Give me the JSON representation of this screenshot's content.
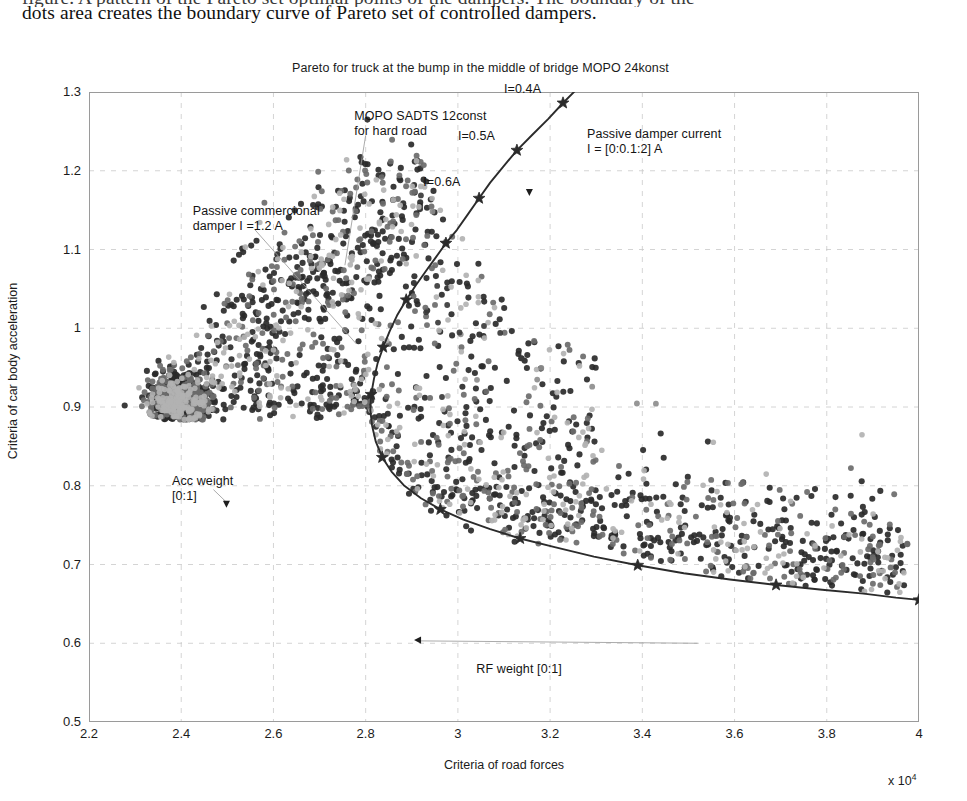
{
  "document": {
    "line_clipped": "figure. A pattern of the Pareto set optimal points of the dampers. The boundary of the",
    "line_full": "dots area creates the boundary curve of Pareto set of controlled dampers."
  },
  "chart_data": {
    "type": "scatter",
    "title": "Pareto  for truck at the bump in the middle of bridge  MOPO 24konst",
    "xlabel": "Criteria of road forces",
    "ylabel": "Criteria of car body acceleration",
    "x_multiplier": "x 10",
    "x_multiplier_exponent": "4",
    "xlim": [
      2.2,
      4.0
    ],
    "ylim": [
      0.5,
      1.3
    ],
    "xticks": [
      "2.2",
      "2.4",
      "2.6",
      "2.8",
      "3",
      "3.2",
      "3.4",
      "3.6",
      "3.8",
      "4"
    ],
    "yticks": [
      "0.5",
      "0.6",
      "0.7",
      "0.8",
      "0.9",
      "1",
      "1.1",
      "1.2",
      "1.3"
    ],
    "grid": true,
    "legend": "none",
    "series": [
      {
        "name": "Pareto boundary curve (controlled dampers)",
        "type": "line",
        "color": "#2b2b2b",
        "marker": "star",
        "points": [
          [
            3.33,
            1.345
          ],
          [
            3.295,
            1.325
          ],
          [
            3.26,
            1.305
          ],
          [
            3.228,
            1.286
          ],
          [
            3.196,
            1.266
          ],
          [
            3.162,
            1.246
          ],
          [
            3.128,
            1.226
          ],
          [
            3.098,
            1.205
          ],
          [
            3.07,
            1.185
          ],
          [
            3.046,
            1.165
          ],
          [
            3.022,
            1.145
          ],
          [
            2.998,
            1.125
          ],
          [
            2.974,
            1.108
          ],
          [
            2.952,
            1.09
          ],
          [
            2.93,
            1.072
          ],
          [
            2.908,
            1.054
          ],
          [
            2.888,
            1.036
          ],
          [
            2.868,
            1.016
          ],
          [
            2.852,
            0.996
          ],
          [
            2.838,
            0.976
          ],
          [
            2.826,
            0.956
          ],
          [
            2.818,
            0.936
          ],
          [
            2.812,
            0.916
          ],
          [
            2.81,
            0.896
          ],
          [
            2.814,
            0.876
          ],
          [
            2.822,
            0.856
          ],
          [
            2.836,
            0.836
          ],
          [
            2.856,
            0.818
          ],
          [
            2.884,
            0.8
          ],
          [
            2.92,
            0.784
          ],
          [
            2.962,
            0.77
          ],
          [
            3.012,
            0.757
          ],
          [
            3.07,
            0.745
          ],
          [
            3.135,
            0.733
          ],
          [
            3.21,
            0.722
          ],
          [
            3.295,
            0.71
          ],
          [
            3.39,
            0.699
          ],
          [
            3.49,
            0.689
          ],
          [
            3.59,
            0.681
          ],
          [
            3.69,
            0.674
          ],
          [
            3.79,
            0.668
          ],
          [
            3.88,
            0.663
          ],
          [
            3.95,
            0.658
          ],
          [
            4.0,
            0.655
          ]
        ],
        "star_markers": [
          [
            3.228,
            1.286
          ],
          [
            3.128,
            1.226
          ],
          [
            3.046,
            1.165
          ],
          [
            2.974,
            1.108
          ],
          [
            2.888,
            1.036
          ],
          [
            2.838,
            0.976
          ],
          [
            2.812,
            0.916
          ],
          [
            2.836,
            0.836
          ],
          [
            2.962,
            0.77
          ],
          [
            3.135,
            0.733
          ],
          [
            3.39,
            0.699
          ],
          [
            3.69,
            0.674
          ],
          [
            4.0,
            0.655
          ]
        ]
      },
      {
        "name": "Controlled damper optimal points (dark)",
        "type": "scatter-cloud",
        "color": "#2a2a2a",
        "count": 1400
      },
      {
        "name": "Controlled damper optimal points (mid)",
        "type": "scatter-cloud",
        "color": "#6b6b6b",
        "count": 700
      },
      {
        "name": "Controlled damper optimal points (light)",
        "type": "scatter-cloud",
        "color": "#b2b2b2",
        "count": 520
      }
    ],
    "annotations": [
      {
        "id": "pareto-current-label",
        "text": "Passive damper current\nI = [0:0.1:2] A",
        "x": 3.28,
        "y": 1.245
      },
      {
        "id": "current-04",
        "text": "I=0.4A",
        "x": 3.1,
        "y": 1.302
      },
      {
        "id": "current-05",
        "text": "I=0.5A",
        "x": 3.0,
        "y": 1.243
      },
      {
        "id": "current-06",
        "text": "I=0.6A",
        "x": 2.925,
        "y": 1.185
      },
      {
        "id": "mopo-sadts-label",
        "text": "MOPO SADTS 12const\nfor hard road",
        "x": 2.775,
        "y": 1.268
      },
      {
        "id": "passive-commercial-label",
        "text": "Passive commercional\ndamper I =1.2 A",
        "x": 2.425,
        "y": 1.148
      },
      {
        "id": "acc-weight-label",
        "text": "Acc weight\n[0:1]",
        "x": 2.38,
        "y": 0.805
      },
      {
        "id": "rf-weight-label",
        "text": "RF weight [0:1]",
        "x": 3.04,
        "y": 0.566
      }
    ]
  }
}
